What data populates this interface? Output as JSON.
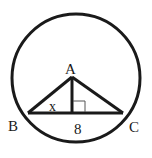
{
  "diagram": {
    "type": "geometry",
    "colors": {
      "stroke": "#1a1a1a",
      "background": "#ffffff"
    },
    "circle": {
      "cx": 76,
      "cy": 78,
      "r": 64
    },
    "points": {
      "A": {
        "label": "A",
        "x": 72,
        "y": 77
      },
      "B": {
        "label": "B",
        "x": 28,
        "y": 113
      },
      "C": {
        "label": "C",
        "x": 123,
        "y": 113
      },
      "foot": {
        "x": 72,
        "y": 113
      }
    },
    "labels": {
      "A": "A",
      "B": "B",
      "C": "C",
      "x": "x",
      "base": "8"
    },
    "annotations": {
      "right_angle_marker": "right angle at foot of altitude from A",
      "segment_BC_length": "8",
      "angle_B": "x"
    }
  }
}
